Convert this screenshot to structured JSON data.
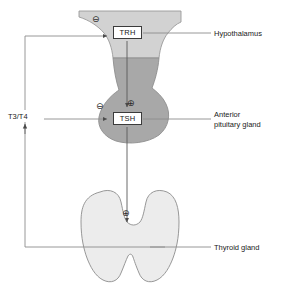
{
  "diagram": {
    "colors": {
      "hypothalamus_fill": "#d2d2d2",
      "pituitary_fill": "#a8a8a8",
      "thyroid_fill": "#ececec",
      "outline": "#8c8c8c",
      "arrow": "#5a5a5a",
      "leader_line": "#8c8c8c",
      "box_border": "#3b3b3b",
      "text": "#1a1a1a",
      "background": "#ffffff"
    },
    "hormone_boxes": [
      {
        "id": "trh",
        "label": "TRH"
      },
      {
        "id": "tsh",
        "label": "TSH"
      }
    ],
    "organ_labels": [
      {
        "id": "hypothalamus",
        "label": "Hypothalamus"
      },
      {
        "id": "pituitary",
        "line1": "Anterior",
        "line2": "pituitary gland"
      },
      {
        "id": "thyroid",
        "label": "Thyroid gland"
      }
    ],
    "feedback_label": "T3/T4",
    "signs": [
      {
        "id": "trh-minus",
        "glyph": "⊖",
        "meaning": "negative-feedback-on-TRH"
      },
      {
        "id": "tsh-minus",
        "glyph": "⊖",
        "meaning": "negative-feedback-on-TSH"
      },
      {
        "id": "tsh-plus",
        "glyph": "⊕",
        "meaning": "TRH-stimulates-TSH"
      },
      {
        "id": "thyroid-plus",
        "glyph": "⊕",
        "meaning": "TSH-stimulates-thyroid"
      }
    ]
  }
}
